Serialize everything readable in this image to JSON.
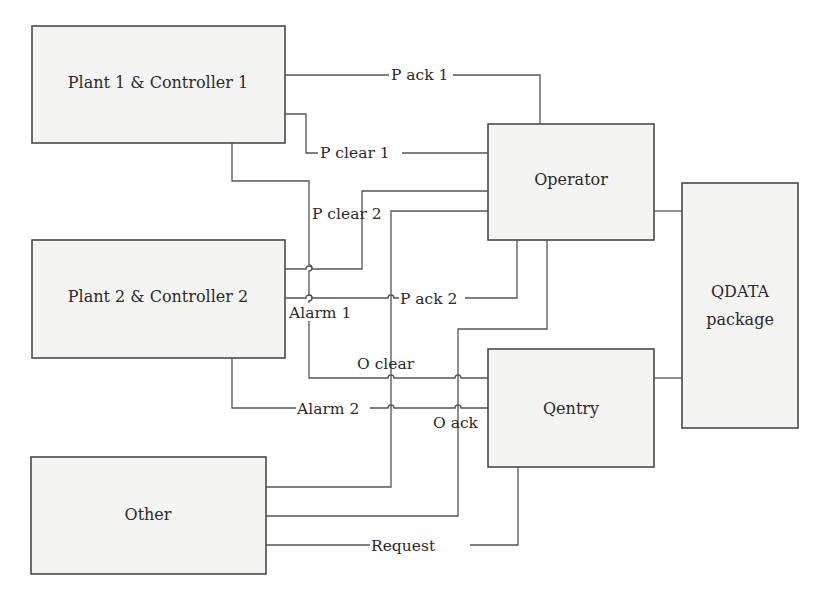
{
  "diagram": {
    "type": "block-diagram",
    "blocks": {
      "plant1": {
        "label": "Plant 1 & Controller 1"
      },
      "plant2": {
        "label": "Plant 2 & Controller 2"
      },
      "other": {
        "label": "Other"
      },
      "operator": {
        "label": "Operator"
      },
      "qentry": {
        "label": "Qentry"
      },
      "qdata_line1": {
        "label": "QDATA"
      },
      "qdata_line2": {
        "label": "package"
      }
    },
    "signals": {
      "p_ack_1": "P ack 1",
      "p_clear_1": "P clear 1",
      "p_clear_2": "P clear 2",
      "p_ack_2": "P ack 2",
      "alarm_1": "Alarm 1",
      "o_clear": "O clear",
      "alarm_2": "Alarm 2",
      "o_ack": "O ack",
      "request": "Request"
    },
    "connections": [
      {
        "from": "Plant 1 & Controller 1",
        "to": "Operator",
        "signal": "P ack 1"
      },
      {
        "from": "Plant 1 & Controller 1",
        "to": "Operator",
        "signal": "P clear 1"
      },
      {
        "from": "Plant 1 & Controller 1",
        "to": "Qentry",
        "signal": "Alarm 1"
      },
      {
        "from": "Plant 2 & Controller 2",
        "to": "Operator",
        "signal": "P clear 2"
      },
      {
        "from": "Plant 2 & Controller 2",
        "to": "Operator",
        "signal": "P ack 2"
      },
      {
        "from": "Plant 2 & Controller 2",
        "to": "Qentry",
        "signal": "Alarm 2"
      },
      {
        "from": "Other",
        "to": "Operator",
        "signal": "O clear"
      },
      {
        "from": "Other",
        "to": "Operator",
        "signal": "O ack"
      },
      {
        "from": "Other",
        "to": "Qentry",
        "signal": "Request"
      },
      {
        "from": "Operator",
        "to": "QDATA package",
        "signal": ""
      },
      {
        "from": "Qentry",
        "to": "QDATA package",
        "signal": ""
      }
    ]
  }
}
